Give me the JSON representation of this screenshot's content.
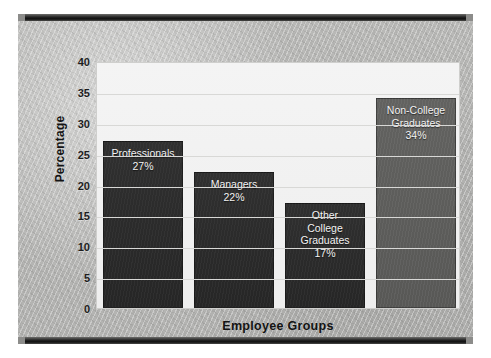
{
  "chart_data": {
    "type": "bar",
    "title": "",
    "xlabel": "Employee Groups",
    "ylabel": "Percentage",
    "ylim": [
      0,
      40
    ],
    "yticks": [
      40,
      35,
      30,
      25,
      20,
      15,
      10,
      5,
      0
    ],
    "grid": true,
    "legend": "none",
    "categories": [
      "Professionals",
      "Managers",
      "Other College Graduates",
      "Non-College Graduates"
    ],
    "values": [
      27,
      22,
      17,
      34
    ],
    "bars": [
      {
        "label": "Professionals",
        "label_text": "Professionals\n27%",
        "value": 27,
        "value_text": "27%",
        "color": "#2b2b2b",
        "style": "dark"
      },
      {
        "label": "Managers",
        "label_text": "Managers\n22%",
        "value": 22,
        "value_text": "22%",
        "color": "#2b2b2b",
        "style": "dark"
      },
      {
        "label": "Other College Graduates",
        "label_text": "Other\nCollege\nGraduates\n17%",
        "value": 17,
        "value_text": "17%",
        "color": "#2b2b2b",
        "style": "dark"
      },
      {
        "label": "Non-College Graduates",
        "label_text": "Non-College\nGraduates\n34%",
        "value": 34,
        "value_text": "34%",
        "color": "#5d5d5d",
        "style": "light"
      }
    ]
  },
  "colors": {
    "bar_dark": "#2b2b2b",
    "bar_light": "#5d5d5d",
    "plot_background": "#f2f2f2",
    "panel_background": "#b6b6b4",
    "gridline": "#d8d8d6",
    "frame_rail": "#1a1a1a",
    "axis_text": "#1d1d1d"
  }
}
